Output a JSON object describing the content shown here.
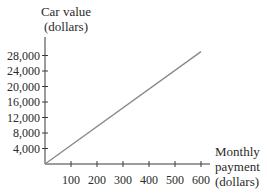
{
  "chart_data": {
    "type": "line",
    "title": "",
    "ylabel": "Car value (dollars)",
    "ylabel_lines": [
      "Car value",
      "(dollars)"
    ],
    "xlabel": "Monthly payment (dollars)",
    "xlabel_lines": [
      "Monthly",
      "payment",
      "(dollars)"
    ],
    "xticks": [
      100,
      200,
      300,
      400,
      500,
      600
    ],
    "xtick_labels": [
      "100",
      "200",
      "300",
      "400",
      "500",
      "600"
    ],
    "yticks": [
      4000,
      8000,
      12000,
      16000,
      20000,
      24000,
      28000
    ],
    "ytick_labels": [
      "4,000",
      "8,000",
      "12,000",
      "16,000",
      "20,000",
      "24,000",
      "28,000"
    ],
    "xlim": [
      0,
      600
    ],
    "ylim": [
      0,
      30000
    ],
    "grid": false,
    "legend": null,
    "series": [
      {
        "name": "Car value",
        "x": [
          0,
          600
        ],
        "y": [
          0,
          29000
        ]
      }
    ]
  }
}
